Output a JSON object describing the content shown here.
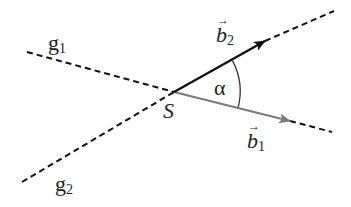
{
  "diagram": {
    "type": "vector-angle",
    "intersection_point": {
      "label": "S",
      "x": 174,
      "y": 92
    },
    "lines": [
      {
        "name": "g1",
        "label": "g",
        "subscript": "1",
        "from": [
          27,
          52
        ],
        "to": [
          332,
          132
        ],
        "style": "dashed",
        "color": "#111111"
      },
      {
        "name": "g2",
        "label": "g",
        "subscript": "2",
        "from": [
          22,
          182
        ],
        "to": [
          334,
          11
        ],
        "style": "dashed",
        "color": "#111111"
      }
    ],
    "vectors": [
      {
        "name": "b1",
        "label": "b",
        "subscript": "1",
        "from": [
          174,
          92
        ],
        "to": [
          290,
          121
        ],
        "color": "#7a7a7a"
      },
      {
        "name": "b2",
        "label": "b",
        "subscript": "2",
        "from": [
          174,
          92
        ],
        "to": [
          265,
          41
        ],
        "color": "#111111"
      }
    ],
    "angle": {
      "label": "α",
      "center": [
        174,
        92
      ],
      "radius": 66
    },
    "labels": {
      "g1_main": "g",
      "g1_sub": "1",
      "g2_main": "g",
      "g2_sub": "2",
      "b1_main": "b",
      "b1_sub": "1",
      "b2_main": "b",
      "b2_sub": "2",
      "S": "S",
      "alpha": "α",
      "vec_arrow": "→"
    }
  }
}
